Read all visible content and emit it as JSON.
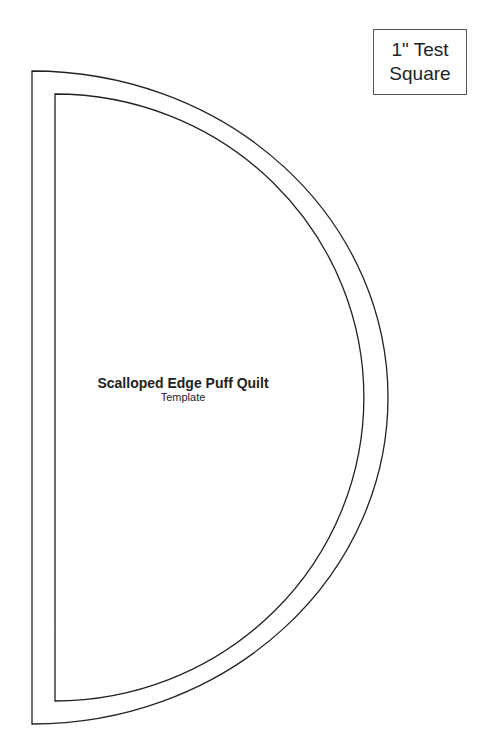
{
  "test_square": {
    "line1": "1\" Test",
    "line2": "Square"
  },
  "template": {
    "title": "Scalloped Edge Puff Quilt",
    "subtitle": "Template"
  },
  "colors": {
    "line": "#222222",
    "background": "#ffffff"
  }
}
